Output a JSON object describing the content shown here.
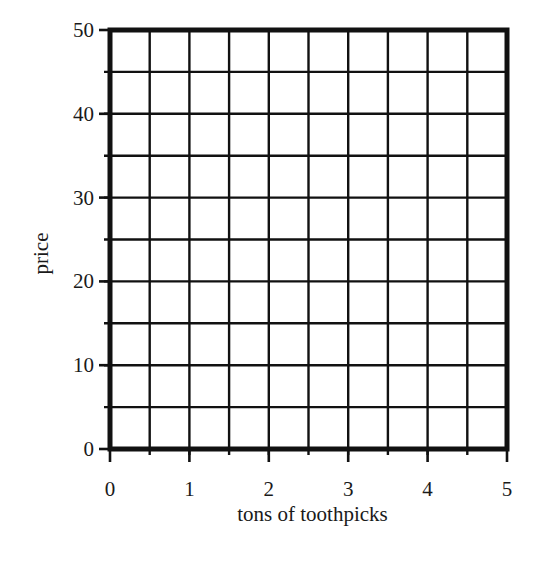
{
  "chart_data": {
    "type": "line",
    "title": "",
    "xlabel": "tons of toothpicks",
    "ylabel": "price",
    "xlim": [
      0,
      5
    ],
    "ylim": [
      0,
      50
    ],
    "x_ticks": [
      "0",
      "1",
      "2",
      "3",
      "4",
      "5"
    ],
    "y_ticks": [
      "0",
      "10",
      "20",
      "30",
      "40",
      "50"
    ],
    "x_minor_step": 0.5,
    "y_minor_step": 5,
    "grid": true,
    "series": [],
    "note": "Blank graph grid with no plotted data"
  },
  "colors": {
    "grid": "#111111",
    "background": "#ffffff"
  }
}
